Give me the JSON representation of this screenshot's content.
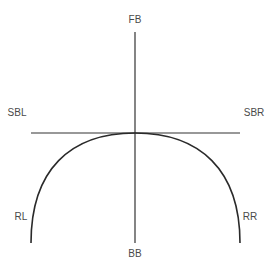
{
  "diagram": {
    "type": "axis-diagram",
    "labels": {
      "top": "FB",
      "bottom": "BB",
      "upper_left": "SBL",
      "upper_right": "SBR",
      "lower_left": "RL",
      "lower_right": "RR"
    },
    "elements": {
      "vertical_axis": {
        "x": 135,
        "y1": 32,
        "y2": 243
      },
      "horizontal_axis": {
        "y": 133,
        "x1": 31,
        "x2": 240
      },
      "curve": {
        "start": [
          31,
          243
        ],
        "apex": [
          135,
          133
        ],
        "end": [
          240,
          243
        ]
      }
    },
    "colors": {
      "background": "#ffffff",
      "line": "#333333",
      "text": "#4a4a4a"
    }
  }
}
